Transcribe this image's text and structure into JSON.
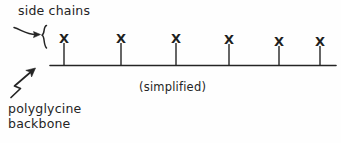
{
  "figure": {
    "background_color": "#fefefe",
    "ink_color": "#242424",
    "annotations": {
      "side_chains": {
        "text": "side chains",
        "x": 18,
        "y": 3
      },
      "simplified": {
        "text": "(simplified)",
        "x": 139,
        "y": 80
      },
      "backbone": {
        "line1": "polyglycine",
        "line2": "backbone",
        "x": 8,
        "y": 101
      }
    },
    "backbone_line": {
      "x_start": 50,
      "x_end": 336,
      "y": 65
    },
    "brace": {
      "symbol": "{",
      "x": 44,
      "y_top": 25,
      "y_bottom": 49
    },
    "curved_arrow": {
      "name": "curved-arrow-to-brace",
      "from_x": 14,
      "from_y": 27,
      "to_x": 41,
      "to_y": 34
    },
    "zigzag_arrow": {
      "name": "zigzag-arrow-to-backbone",
      "from_x": 10,
      "from_y": 97,
      "to_x": 35,
      "to_y": 70
    },
    "side_chain_marks": [
      {
        "label": "X",
        "x": 64,
        "x_top_y": 32,
        "stem_top": 43,
        "stem_bottom": 65
      },
      {
        "label": "X",
        "x": 121,
        "x_top_y": 32,
        "stem_top": 43,
        "stem_bottom": 65
      },
      {
        "label": "X",
        "x": 176,
        "x_top_y": 32,
        "stem_top": 43,
        "stem_bottom": 65
      },
      {
        "label": "X",
        "x": 229,
        "x_top_y": 33,
        "stem_top": 44,
        "stem_bottom": 65
      },
      {
        "label": "X",
        "x": 279,
        "x_top_y": 35,
        "stem_top": 46,
        "stem_bottom": 65
      },
      {
        "label": "X",
        "x": 320,
        "x_top_y": 35,
        "stem_top": 46,
        "stem_bottom": 65
      }
    ]
  }
}
